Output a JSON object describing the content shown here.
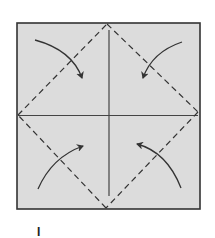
{
  "diagram": {
    "type": "origami-fold-instruction",
    "paper": {
      "x": 17,
      "y": 23,
      "width": 183,
      "height": 186,
      "fill": "#dcdcdc",
      "stroke": "#333333"
    },
    "crease_lines": [
      {
        "name": "vertical-crease",
        "x1": 109,
        "y1": 30,
        "y2": 196
      },
      {
        "name": "horizontal-crease",
        "x1": 18,
        "x2": 198,
        "y1": 115
      }
    ],
    "fold_lines_dashed": [
      {
        "name": "valley-fold-top-left",
        "from": [
          18,
          115
        ],
        "to": [
          107,
          24
        ]
      },
      {
        "name": "valley-fold-top-right",
        "from": [
          107,
          24
        ],
        "to": [
          198,
          112
        ]
      },
      {
        "name": "valley-fold-bottom-right",
        "from": [
          198,
          112
        ],
        "to": [
          106,
          208
        ]
      },
      {
        "name": "valley-fold-bottom-left",
        "from": [
          106,
          208
        ],
        "to": [
          18,
          115
        ]
      }
    ],
    "arrows": [
      {
        "name": "fold-arrow-top-left",
        "direction": "corner-to-center"
      },
      {
        "name": "fold-arrow-top-right",
        "direction": "corner-to-center"
      },
      {
        "name": "fold-arrow-bottom-left",
        "direction": "corner-to-center"
      },
      {
        "name": "fold-arrow-bottom-right",
        "direction": "corner-to-center"
      }
    ],
    "colors": {
      "line": "#3a3a3a",
      "paper": "#dcdcdc",
      "background": "#ffffff"
    }
  },
  "step_label": "I"
}
